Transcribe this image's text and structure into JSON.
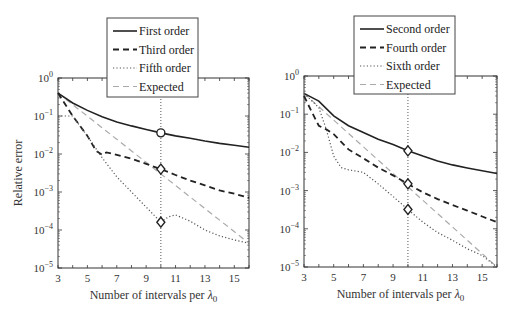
{
  "chart_data": [
    {
      "type": "line",
      "panel": "left",
      "title": "",
      "xlabel": "Number of intervals per λ0",
      "ylabel": "Relative error",
      "yscale": "log",
      "xlim": [
        3,
        16
      ],
      "ylim": [
        1e-05,
        1
      ],
      "xticks": [
        3,
        5,
        7,
        9,
        11,
        13,
        15
      ],
      "yticks": [
        "10^0",
        "10^-1",
        "10^-2",
        "10^-3",
        "10^-4",
        "10^-5"
      ],
      "grid": false,
      "legend_position": "top-center (above axes, overlapping)",
      "vline_x": 10,
      "series": [
        {
          "name": "First order",
          "style": "solid",
          "x": [
            3,
            4,
            5,
            6,
            7,
            8,
            9,
            10,
            11,
            12,
            13,
            14,
            15,
            16
          ],
          "y": [
            0.4,
            0.22,
            0.14,
            0.095,
            0.07,
            0.055,
            0.044,
            0.036,
            0.03,
            0.026,
            0.022,
            0.019,
            0.017,
            0.015
          ],
          "marker_at_x10": "circle"
        },
        {
          "name": "Third order",
          "style": "dashed",
          "x": [
            3,
            4,
            5,
            5.6,
            6,
            6.3,
            7,
            8,
            9,
            10,
            11,
            12,
            13,
            14,
            15,
            16
          ],
          "y": [
            0.4,
            0.1,
            0.03,
            0.012,
            0.0095,
            0.011,
            0.0095,
            0.0075,
            0.0055,
            0.004,
            0.0028,
            0.002,
            0.0015,
            0.0011,
            0.0009,
            0.0007
          ],
          "marker_at_x10": "diamond"
        },
        {
          "name": "Fifth order",
          "style": "dotted",
          "x": [
            3,
            4,
            5,
            6,
            7,
            8,
            9,
            10,
            10.5,
            11,
            12,
            13,
            14,
            15,
            16
          ],
          "y": [
            0.1,
            0.1,
            0.03,
            0.008,
            0.0025,
            0.001,
            0.0004,
            0.00016,
            0.00022,
            0.00025,
            0.00017,
            0.0001,
            7e-05,
            5.5e-05,
            4.5e-05
          ],
          "marker_at_x10": "diamond"
        },
        {
          "name": "Expected",
          "style": "dashed-light",
          "x": [
            3,
            16
          ],
          "y": [
            0.4,
            4.5e-05
          ]
        }
      ]
    },
    {
      "type": "line",
      "panel": "right",
      "title": "",
      "xlabel": "Number of intervals per λ0",
      "ylabel": "",
      "yscale": "log",
      "xlim": [
        3,
        16
      ],
      "ylim": [
        1e-05,
        1
      ],
      "xticks": [
        3,
        5,
        7,
        9,
        11,
        13,
        15
      ],
      "yticks": [
        "10^0",
        "10^-1",
        "10^-2",
        "10^-3",
        "10^-4",
        "10^-5"
      ],
      "grid": false,
      "legend_position": "top-center (above axes, overlapping)",
      "vline_x": 10,
      "series": [
        {
          "name": "Second order",
          "style": "solid",
          "x": [
            3,
            4,
            5,
            6,
            7,
            8,
            9,
            10,
            11,
            12,
            13,
            14,
            15,
            16
          ],
          "y": [
            0.35,
            0.22,
            0.09,
            0.05,
            0.033,
            0.022,
            0.016,
            0.011,
            0.008,
            0.006,
            0.0047,
            0.0039,
            0.0033,
            0.0028
          ],
          "marker_at_x10": "diamond"
        },
        {
          "name": "Fourth order",
          "style": "dashed",
          "x": [
            3,
            3.5,
            4,
            4.5,
            5,
            6,
            7,
            8,
            9,
            10,
            11,
            12,
            13,
            14,
            15,
            16
          ],
          "y": [
            0.3,
            0.12,
            0.05,
            0.04,
            0.03,
            0.012,
            0.007,
            0.004,
            0.0025,
            0.0015,
            0.0009,
            0.0006,
            0.00042,
            0.0003,
            0.00021,
            0.00015
          ],
          "marker_at_x10": "diamond"
        },
        {
          "name": "Sixth order",
          "style": "dotted",
          "x": [
            3,
            4,
            4.5,
            5,
            5.5,
            6,
            7,
            8,
            9,
            10,
            11,
            12,
            13,
            14,
            15,
            16
          ],
          "y": [
            0.35,
            0.15,
            0.04,
            0.008,
            0.004,
            0.0035,
            0.003,
            0.0015,
            0.0007,
            0.00032,
            0.00015,
            8e-05,
            5e-05,
            3e-05,
            2e-05,
            1e-05
          ],
          "marker_at_x10": "diamond"
        },
        {
          "name": "Expected",
          "style": "dashed-light",
          "x": [
            3,
            16
          ],
          "y": [
            0.35,
            1e-05
          ]
        }
      ]
    }
  ],
  "panels": {
    "left": {
      "ylabel": "Relative error",
      "xlabel_main": "Number of intervals per ",
      "xlabel_sym": "λ",
      "xlabel_sub": "0",
      "legend": [
        "First order",
        "Third order",
        "Fifth order",
        "Expected"
      ]
    },
    "right": {
      "xlabel_main": "Number of intervals per ",
      "xlabel_sym": "λ",
      "xlabel_sub": "0",
      "legend": [
        "Second order",
        "Fourth order",
        "Sixth order",
        "Expected"
      ]
    }
  },
  "ticks": {
    "x": [
      "3",
      "5",
      "7",
      "9",
      "11",
      "13",
      "15"
    ],
    "y_exp": [
      "0",
      "-1",
      "-2",
      "-3",
      "-4",
      "-5"
    ],
    "y_base": "10"
  },
  "colors": {
    "main": "#222222",
    "expected": "#aaaaaa",
    "frame": "#333333"
  }
}
